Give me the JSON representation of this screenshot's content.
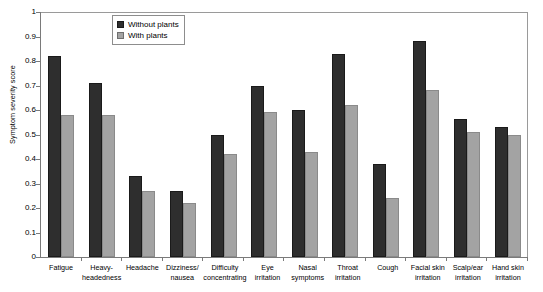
{
  "chart_data": {
    "type": "bar",
    "title": "",
    "xlabel": "",
    "ylabel": "Symptom severity score",
    "ylim": [
      0,
      1
    ],
    "ytick_labels": [
      "1",
      "0.9",
      "0.8",
      "0.7",
      "0.6",
      "0.5",
      "0.4",
      "0.3",
      "0.2",
      "0.1",
      "0"
    ],
    "ytick_values": [
      1,
      0.9,
      0.8,
      0.7,
      0.6,
      0.5,
      0.4,
      0.3,
      0.2,
      0.1,
      0
    ],
    "grid": false,
    "legend_position": "top-left-inside",
    "categories": [
      "Fatigue",
      "Heavy-headedness",
      "Headache",
      "Dizziness/ nausea",
      "Difficulty concentrating",
      "Eye irritation",
      "Nasal symptoms",
      "Throat irritation",
      "Cough",
      "Facial skin irritation",
      "Scalp/ear irritation",
      "Hand skin irritation"
    ],
    "category_lines": [
      [
        "Fatigue"
      ],
      [
        "Heavy-",
        "headedness"
      ],
      [
        "Headache"
      ],
      [
        "Dizziness/",
        "nausea"
      ],
      [
        "Difficulty",
        "concentrating"
      ],
      [
        "Eye",
        "irritation"
      ],
      [
        "Nasal",
        "symptoms"
      ],
      [
        "Throat",
        "irritation"
      ],
      [
        "Cough"
      ],
      [
        "Facial skin",
        "irritation"
      ],
      [
        "Scalp/ear",
        "irritation"
      ],
      [
        "Hand skin",
        "irritation"
      ]
    ],
    "series": [
      {
        "name": "Without plants",
        "color": "#2e2e2e",
        "values": [
          0.82,
          0.71,
          0.33,
          0.27,
          0.5,
          0.7,
          0.6,
          0.83,
          0.38,
          0.88,
          0.565,
          0.53
        ]
      },
      {
        "name": "With plants",
        "color": "#a3a3a3",
        "values": [
          0.58,
          0.58,
          0.27,
          0.22,
          0.42,
          0.59,
          0.43,
          0.62,
          0.24,
          0.68,
          0.51,
          0.5
        ]
      }
    ]
  }
}
